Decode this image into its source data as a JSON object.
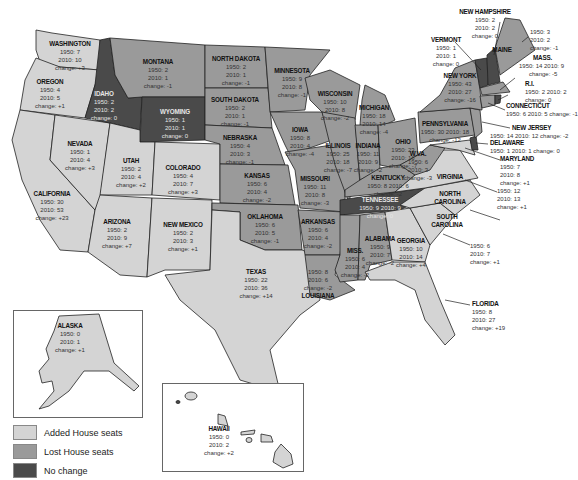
{
  "legend": {
    "items": [
      {
        "label": "Added House seats",
        "color": "#d4d4d4"
      },
      {
        "label": "Lost House seats",
        "color": "#9a9a9a"
      },
      {
        "label": "No change",
        "color": "#4a4a4a"
      }
    ]
  },
  "states": {
    "washington": {
      "name": "WASHINGTON",
      "y1950": "1950: 7",
      "y2010": "2010: 10",
      "change": "change: +3"
    },
    "oregon": {
      "name": "OREGON",
      "y1950": "1950: 4",
      "y2010": "2010: 5",
      "change": "change: +1"
    },
    "california": {
      "name": "CALIFORNIA",
      "y1950": "1950: 30",
      "y2010": "2010: 53",
      "change": "change: +23"
    },
    "nevada": {
      "name": "NEVADA",
      "y1950": "1950: 1",
      "y2010": "2010: 4",
      "change": "change: +3"
    },
    "idaho": {
      "name": "IDAHO",
      "y1950": "1950: 2",
      "y2010": "2010: 2",
      "change": "change: 0"
    },
    "montana": {
      "name": "MONTANA",
      "y1950": "1950: 2",
      "y2010": "2010: 1",
      "change": "change: -1"
    },
    "wyoming": {
      "name": "WYOMING",
      "y1950": "1950: 1",
      "y2010": "2010: 1",
      "change": "change: 0"
    },
    "utah": {
      "name": "UTAH",
      "y1950": "1950: 2",
      "y2010": "2010: 4",
      "change": "change: +2"
    },
    "colorado": {
      "name": "COLORADO",
      "y1950": "1950: 4",
      "y2010": "2010: 7",
      "change": "change: +3"
    },
    "arizona": {
      "name": "ARIZONA",
      "y1950": "1950: 2",
      "y2010": "2010: 9",
      "change": "change: +7"
    },
    "new_mexico": {
      "name": "NEW MEXICO",
      "y1950": "1950: 2",
      "y2010": "2010: 3",
      "change": "change: +1"
    },
    "north_dakota": {
      "name": "NORTH DAKOTA",
      "y1950": "1950: 2",
      "y2010": "2010: 1",
      "change": "change: -1"
    },
    "south_dakota": {
      "name": "SOUTH DAKOTA",
      "y1950": "1950: 2",
      "y2010": "2010: 1",
      "change": "change: -1"
    },
    "nebraska": {
      "name": "NEBRASKA",
      "y1950": "1950: 4",
      "y2010": "2010: 3",
      "change": "change: -1"
    },
    "kansas": {
      "name": "KANSAS",
      "y1950": "1950: 6",
      "y2010": "2010: 4",
      "change": "change: -2"
    },
    "oklahoma": {
      "name": "OKLAHOMA",
      "y1950": "1950: 6",
      "y2010": "2010: 5",
      "change": "change: -1"
    },
    "texas": {
      "name": "TEXAS",
      "y1950": "1950: 22",
      "y2010": "2010: 36",
      "change": "change: +14"
    },
    "minnesota": {
      "name": "MINNESOTA",
      "y1950": "1950: 9",
      "y2010": "2010: 8",
      "change": "change: -1"
    },
    "iowa": {
      "name": "IOWA",
      "y1950": "1950: 8",
      "y2010": "2010: 4",
      "change": "change: -4"
    },
    "missouri": {
      "name": "MISSOURI",
      "y1950": "1950: 11",
      "y2010": "2010: 8",
      "change": "change: -3"
    },
    "arkansas": {
      "name": "ARKANSAS",
      "y1950": "1950: 6",
      "y2010": "2010: 4",
      "change": "change: -2"
    },
    "louisiana": {
      "name": "LOUISIANA",
      "y1950": "1950: 8",
      "y2010": "2010: 6",
      "change": "change: -2"
    },
    "wisconsin": {
      "name": "WISCONSIN",
      "y1950": "1950: 10",
      "y2010": "2010: 8",
      "change": "change: -2"
    },
    "illinois": {
      "name": "ILLINOIS",
      "y1950": "1950: 25",
      "y2010": "2010: 18",
      "change": "change: -7"
    },
    "michigan": {
      "name": "MICHIGAN",
      "y1950": "1950: 18",
      "y2010": "2010: 14",
      "change": "change: -4"
    },
    "indiana": {
      "name": "INDIANA",
      "y1950": "1950: 11",
      "y2010": "2010: 9",
      "change": "change: -2"
    },
    "ohio": {
      "name": "OHIO",
      "y1950": "1950: 23",
      "y2010": "2010: 16",
      "change": "change: -7"
    },
    "kentucky": {
      "name": "KENTUCKY",
      "y1950": "1950: 8",
      "y2010": "2010: 6",
      "change": "change: -2"
    },
    "tennessee": {
      "name": "TENNESSEE",
      "y1950": "1950: 9",
      "y2010": "2010: 9",
      "change": "change: 0"
    },
    "mississippi": {
      "name": "MISS.",
      "y1950": "1950: 6",
      "y2010": "2010: 4",
      "change": "change: -2"
    },
    "alabama": {
      "name": "ALABAMA",
      "y1950": "1950: 9",
      "y2010": "2010: 7",
      "change": "change: -2"
    },
    "georgia": {
      "name": "GEORGIA",
      "y1950": "1950: 10",
      "y2010": "2010: 14",
      "change": "change: +4"
    },
    "florida": {
      "name": "FLORIDA",
      "y1950": "1950: 8",
      "y2010": "2010: 27",
      "change": "change: +19"
    },
    "south_carolina": {
      "name": "SOUTH CAROLINA",
      "y1950": "1950: 6",
      "y2010": "2010: 7",
      "change": "change: +1"
    },
    "north_carolina": {
      "name": "NORTH CAROLINA",
      "y1950": "1950: 12",
      "y2010": "2010: 13",
      "change": "change: +1"
    },
    "virginia": {
      "name": "VIRGINIA",
      "y1950": "1950: 10",
      "y2010": "2010: 11",
      "change": "change: +1"
    },
    "west_virginia": {
      "name": "W.VA.",
      "y1950": "1950: 6",
      "y2010": "2010: 3",
      "change": "change: -3"
    },
    "pennsylvania": {
      "name": "PENNSYLVANIA",
      "y1950": "1950: 30",
      "y2010": "2010: 18",
      "change": "change: -12"
    },
    "new_york": {
      "name": "NEW YORK",
      "y1950": "1950: 43",
      "y2010": "2010: 27",
      "change": "change: -16"
    },
    "maryland": {
      "name": "MARYLAND",
      "y1950": "1950: 7",
      "y2010": "2010: 8",
      "change": "change: +1"
    },
    "delaware": {
      "name": "DELAWARE",
      "line": "1950: 1 2010: 1 change: 0"
    },
    "new_jersey": {
      "name": "NEW JERSEY",
      "line": "1950: 14 2010: 12 change: -2"
    },
    "connecticut": {
      "name": "CONNECTICUT",
      "line": "1950: 6 2010: 5 change: -1"
    },
    "rhode_island": {
      "name": "R.I.",
      "line1": "1950: 2 2010: 2",
      "change": "change: 0"
    },
    "massachusetts": {
      "name": "MASS.",
      "line1": "1950: 14 2010: 9",
      "change": "change: -5"
    },
    "maine": {
      "name": "MAINE",
      "y1950": "1950: 3",
      "y2010": "2010: 2",
      "change": "change: -1"
    },
    "new_hampshire": {
      "name": "NEW HAMPSHIRE",
      "y1950": "1950: 2",
      "y2010": "2010: 2",
      "change": "change: 0"
    },
    "vermont": {
      "name": "VERMONT",
      "y1950": "1950: 1",
      "y2010": "2010: 1",
      "change": "change: 0"
    },
    "alaska": {
      "name": "ALASKA",
      "y1950": "1950: 0",
      "y2010": "2010: 1",
      "change": "change: +1"
    },
    "hawaii": {
      "name": "HAWAII",
      "y1950": "1950: 0",
      "y2010": "2010: 2",
      "change": "change: +2"
    }
  }
}
